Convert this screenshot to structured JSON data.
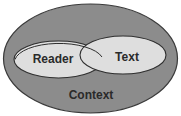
{
  "diagram": {
    "type": "venn",
    "outer": {
      "label": "Context",
      "fill": "#8c8c8c",
      "stroke": "#3a3a3a"
    },
    "circles": [
      {
        "label": "Reader",
        "fill": "#dedede",
        "stroke": "#2e2e2e"
      },
      {
        "label": "Text",
        "fill": "#dedede",
        "stroke": "#2e2e2e"
      }
    ]
  }
}
